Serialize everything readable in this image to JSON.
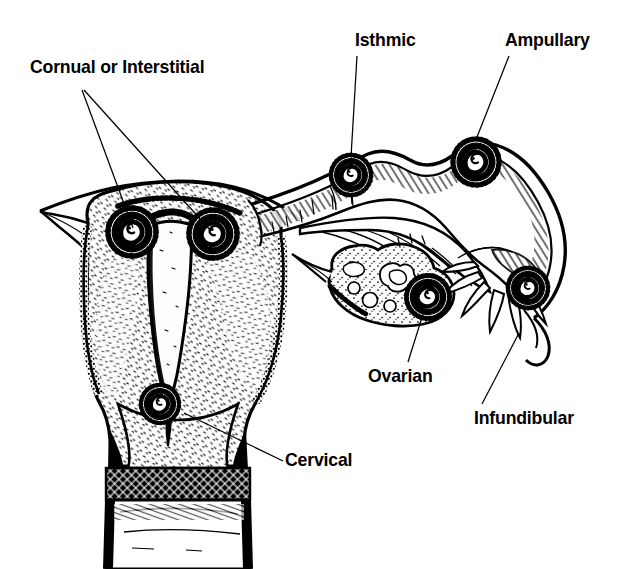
{
  "figure": {
    "background_color": "#ffffff",
    "ink_color": "#000000",
    "width": 625,
    "height": 569
  },
  "labels": {
    "cornual": "Cornual or Interstitial",
    "isthmic": "Isthmic",
    "ampullary": "Ampullary",
    "ovarian": "Ovarian",
    "infundibular": "Infundibular",
    "cervical": "Cervical"
  },
  "anatomy": {
    "uterus": "uterus-cross-section",
    "uterine_cavity": "endometrial-cavity",
    "cervix": "cervix",
    "vagina": "vagina",
    "fallopian_tube": "fallopian-tube",
    "ovary": "ovary",
    "fimbriae": "fimbriae"
  },
  "implantation_sites": [
    {
      "id": "cornual-left",
      "label": "Cornual or Interstitial",
      "x": 132,
      "y": 232
    },
    {
      "id": "cornual-right",
      "label": "Cornual or Interstitial",
      "x": 213,
      "y": 234
    },
    {
      "id": "isthmic",
      "label": "Isthmic",
      "x": 351,
      "y": 175
    },
    {
      "id": "ampullary",
      "label": "Ampullary",
      "x": 476,
      "y": 162
    },
    {
      "id": "ovarian",
      "label": "Ovarian",
      "x": 428,
      "y": 297
    },
    {
      "id": "infundibular",
      "label": "Infundibular",
      "x": 528,
      "y": 288
    },
    {
      "id": "cervical",
      "label": "Cervical",
      "x": 160,
      "y": 404
    }
  ],
  "leader_lines": [
    {
      "id": "cornual-left",
      "from": [
        82,
        90
      ],
      "to": [
        133,
        228
      ]
    },
    {
      "id": "cornual-right",
      "from": [
        84,
        90
      ],
      "to": [
        211,
        231
      ]
    },
    {
      "id": "isthmic",
      "from": [
        357,
        56
      ],
      "to": [
        351,
        157
      ]
    },
    {
      "id": "ampullary",
      "from": [
        509,
        56
      ],
      "to": [
        477,
        137
      ]
    },
    {
      "id": "ovarian",
      "from": [
        408,
        362
      ],
      "to": [
        424,
        311
      ]
    },
    {
      "id": "infundibular",
      "from": [
        482,
        404
      ],
      "to": [
        519,
        333
      ]
    },
    {
      "id": "cervical",
      "from": [
        283,
        461
      ],
      "to": [
        184,
        413
      ]
    }
  ]
}
